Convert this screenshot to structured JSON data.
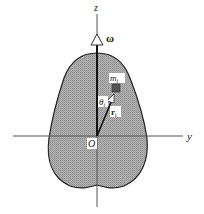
{
  "figure": {
    "type": "rigid-body-rotation-diagram",
    "axes": {
      "z_label": "z",
      "y_label": "y",
      "origin_label": "O"
    },
    "angular_velocity_label": "ω",
    "mass_element_label": "m",
    "mass_element_subscript": "i",
    "position_vector_label": "r",
    "position_vector_subscript": "i",
    "angle_label": "θ",
    "angle_subscript": "i",
    "colors": {
      "body_fill": "#a9a9a9",
      "outline": "#222222",
      "mass_square": "#555555",
      "background": "#ffffff"
    }
  }
}
